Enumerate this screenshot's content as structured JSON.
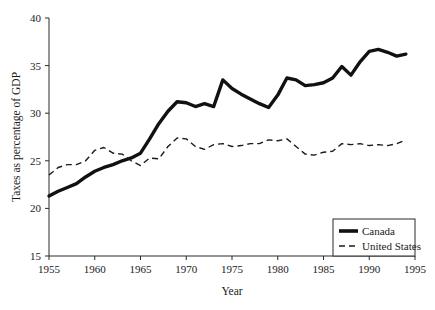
{
  "chart_data": {
    "type": "line",
    "title": "",
    "xlabel": "Year",
    "ylabel": "Taxes as percentage of GDP",
    "xlim": [
      1955,
      1995
    ],
    "ylim": [
      15,
      40
    ],
    "xticks": [
      1955,
      1960,
      1965,
      1970,
      1975,
      1980,
      1985,
      1990,
      1995
    ],
    "yticks": [
      15,
      20,
      25,
      30,
      35,
      40
    ],
    "grid": false,
    "legend_position": "bottom-right",
    "x": [
      1955,
      1956,
      1957,
      1958,
      1959,
      1960,
      1961,
      1962,
      1963,
      1964,
      1965,
      1966,
      1967,
      1968,
      1969,
      1970,
      1971,
      1972,
      1973,
      1974,
      1975,
      1976,
      1977,
      1978,
      1979,
      1980,
      1981,
      1982,
      1983,
      1984,
      1985,
      1986,
      1987,
      1988,
      1989,
      1990,
      1991,
      1992,
      1993,
      1994
    ],
    "series": [
      {
        "name": "Canada",
        "style": "solid-thick",
        "color": "#111111",
        "values": [
          21.3,
          21.8,
          22.2,
          22.6,
          23.3,
          23.9,
          24.3,
          24.6,
          25.0,
          25.3,
          25.8,
          27.3,
          28.9,
          30.2,
          31.2,
          31.1,
          30.7,
          31.0,
          30.7,
          33.5,
          32.6,
          32.0,
          31.5,
          31.0,
          30.6,
          31.9,
          33.7,
          33.5,
          32.9,
          33.0,
          33.2,
          33.7,
          34.9,
          34.0,
          35.4,
          36.5,
          36.7,
          36.4,
          36.0,
          36.2
        ]
      },
      {
        "name": "United States",
        "style": "dashed",
        "color": "#1a1a1a",
        "values": [
          23.5,
          24.3,
          24.6,
          24.6,
          25.0,
          26.1,
          26.4,
          25.8,
          25.7,
          25.0,
          24.5,
          25.3,
          25.2,
          26.5,
          27.4,
          27.3,
          26.5,
          26.2,
          26.7,
          26.8,
          26.5,
          26.6,
          26.8,
          26.8,
          27.2,
          27.1,
          27.3,
          26.5,
          25.7,
          25.6,
          25.9,
          26.0,
          26.8,
          26.7,
          26.8,
          26.6,
          26.7,
          26.6,
          26.8,
          27.2
        ]
      }
    ]
  },
  "legend": {
    "entries": [
      {
        "label": "Canada"
      },
      {
        "label": "United States"
      }
    ]
  },
  "axis": {
    "x_title": "Year",
    "y_title": "Taxes as percentage of GDP"
  }
}
